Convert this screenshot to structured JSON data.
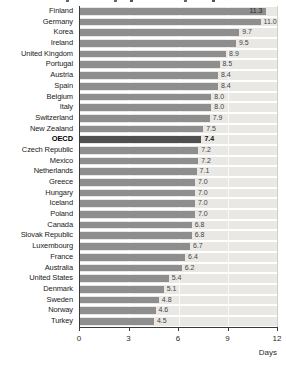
{
  "chart_data": {
    "type": "bar",
    "orientation": "horizontal",
    "title": "",
    "xlabel": "Days",
    "xlim": [
      0,
      12
    ],
    "x_ticks": [
      "0",
      "3",
      "6",
      "9",
      "12"
    ],
    "x_tick_values": [
      0,
      3,
      6,
      9,
      12
    ],
    "grid": "vertical-light",
    "emphasized_category": "OECD",
    "inside_label_categories": [
      "Finland"
    ],
    "categories": [
      "Finland",
      "Germany",
      "Korea",
      "Ireland",
      "United Kingdom",
      "Portugal",
      "Austria",
      "Spain",
      "Belgium",
      "Italy",
      "Switzerland",
      "New Zealand",
      "OECD",
      "Czech Republic",
      "Mexico",
      "Netherlands",
      "Greece",
      "Hungary",
      "Iceland",
      "Poland",
      "Canada",
      "Slovak Republic",
      "Luxembourg",
      "France",
      "Australia",
      "United States",
      "Denmark",
      "Sweden",
      "Norway",
      "Turkey"
    ],
    "values": [
      11.3,
      11.0,
      9.7,
      9.5,
      8.9,
      8.5,
      8.4,
      8.4,
      8.0,
      8.0,
      7.9,
      7.5,
      7.4,
      7.2,
      7.2,
      7.1,
      7.0,
      7.0,
      7.0,
      7.0,
      6.8,
      6.8,
      6.7,
      6.4,
      6.2,
      5.4,
      5.1,
      4.8,
      4.6,
      4.5
    ],
    "value_labels": [
      "11.3",
      "11.0",
      "9.7",
      "9.5",
      "8.9",
      "8.5",
      "8.4",
      "8.4",
      "8.0",
      "8.0",
      "7.9",
      "7.5",
      "7.4",
      "7.2",
      "7.2",
      "7.1",
      "7.0",
      "7.0",
      "7.0",
      "7.0",
      "6.8",
      "6.8",
      "6.7",
      "6.4",
      "6.2",
      "5.4",
      "5.1",
      "4.8",
      "4.6",
      "4.5"
    ],
    "colors": {
      "bar": "#8e8e8e",
      "emphasis_bar": "#4f4f4f",
      "track": "#e9e8e4",
      "axis": "#3a3a3a",
      "plot_background": "#ffffff",
      "value_text": "#454545",
      "label_text": "#222222"
    }
  }
}
